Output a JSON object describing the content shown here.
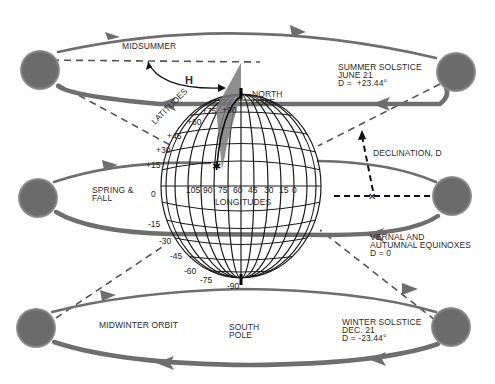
{
  "colors": {
    "sun": "#6b6b6b",
    "orbit": "#6e6e6e",
    "grid": "#1a1a1a",
    "dashed": "#555555",
    "text": "#2a2a2a",
    "background": "#ffffff"
  },
  "labels": {
    "midsummer": "MIDSUMMER",
    "hour_angle": "H",
    "north_pole": "NORTH\nPOLE",
    "south_pole": "SOUTH\nPOLE",
    "summer_solstice": "SUMMER SOLSTICE\nJUNE 21\nD =  +23.44°",
    "declination": "DECLINATION, D",
    "spring_fall": "SPRING &\nFALL",
    "equinoxes": "VERNAL AND\nAUTUMNAL EQUINOXES\nD = 0",
    "midwinter": "MIDWINTER ORBIT",
    "winter_solstice": "WINTER SOLSTICE\nDEC. 21\nD = -23.44°",
    "latitudes": "LATITUDES",
    "longitudes": "LONGITUDES"
  },
  "latitude_ticks": [
    "+90",
    "+75",
    "+60",
    "+45",
    "+30",
    "+15",
    "0",
    "-15",
    "-30",
    "-45",
    "-60",
    "-75",
    "-90"
  ],
  "longitude_ticks": [
    "105",
    "90",
    "75",
    "60",
    "45",
    "30",
    "15",
    "0"
  ],
  "suns": [
    {
      "name": "midsummer-left",
      "cx": 40,
      "cy": 70
    },
    {
      "name": "summer-solstice-right",
      "cx": 456,
      "cy": 72
    },
    {
      "name": "equinox-left",
      "cx": 38,
      "cy": 198
    },
    {
      "name": "equinox-right",
      "cx": 452,
      "cy": 196
    },
    {
      "name": "midwinter-left",
      "cx": 36,
      "cy": 328
    },
    {
      "name": "winter-solstice-right",
      "cx": 451,
      "cy": 327
    }
  ]
}
